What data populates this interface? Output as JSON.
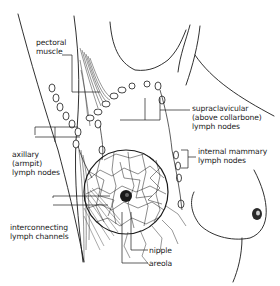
{
  "diagram": {
    "labels": {
      "pectoral_muscle": "pectoral\nmuscle",
      "supraclavicular": "supraclavicular\n(above collarbone)\nlymph nodes",
      "axillary": "axillary\n(armpit)\nlymph nodes",
      "internal_mammary": "internal mammary\nlymph nodes",
      "interconnecting": "interconnecting\nlymph channels",
      "nipple": "nipple",
      "areola": "areola"
    },
    "colors": {
      "ink": "#1a1a1a",
      "background": "#ffffff"
    }
  }
}
